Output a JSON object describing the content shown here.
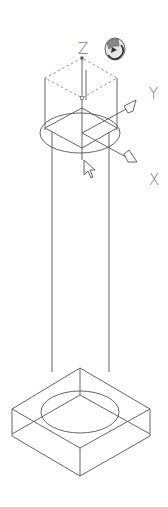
{
  "viewport": {
    "background": "#ffffff",
    "line_color": "#555555",
    "view": "3D isometric wireframe"
  },
  "gizmo": {
    "axes": [
      {
        "label": "Z"
      },
      {
        "label": "Y"
      },
      {
        "label": "X"
      }
    ],
    "rotate_icon": "orbit-rotate-icon"
  },
  "model": {
    "parts": [
      "column-top-ellipse",
      "column-shaft",
      "base-block",
      "base-ellipse"
    ]
  },
  "cursor": "arrow-pointer"
}
